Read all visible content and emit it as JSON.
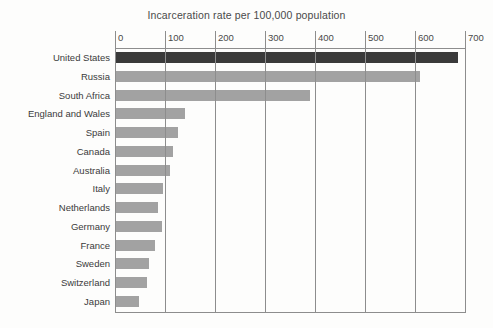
{
  "chart_data": {
    "type": "bar",
    "orientation": "horizontal",
    "title": "Incarceration rate per 100,000 population",
    "xlabel": "",
    "ylabel": "",
    "xlim": [
      0,
      700
    ],
    "xticks": [
      0,
      100,
      200,
      300,
      400,
      500,
      600,
      700
    ],
    "grid": true,
    "legend": null,
    "categories": [
      "United States",
      "Russia",
      "South Africa",
      "England and Wales",
      "Spain",
      "Canada",
      "Australia",
      "Italy",
      "Netherlands",
      "Germany",
      "France",
      "Sweden",
      "Switzerland",
      "Japan"
    ],
    "values": [
      686,
      610,
      390,
      140,
      125,
      115,
      110,
      96,
      86,
      93,
      80,
      68,
      63,
      48
    ],
    "highlight_index": 0,
    "colors": {
      "bar": "#a2a2a2",
      "highlight_bar": "#3a3a3a",
      "gridline": "#8d8d8d",
      "text": "#3b3b3b",
      "background": "#fdfdfc"
    }
  }
}
